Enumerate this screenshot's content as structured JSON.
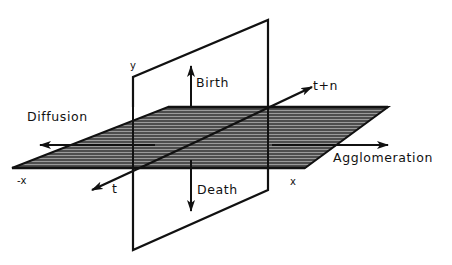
{
  "diagram": {
    "colors": {
      "stroke": "#111111",
      "hatch_fill": "#7a7a7a",
      "hatch_line": "#1a1a1a",
      "background": "#ffffff"
    },
    "labels": {
      "birth": "Birth",
      "death": "Death",
      "diffusion": "Diffusion",
      "agglomeration": "Agglomeration",
      "t": "t",
      "t_plus_n": "t+n",
      "y_axis": "y",
      "x_axis": "x",
      "neg_x_axis": "-x"
    }
  }
}
